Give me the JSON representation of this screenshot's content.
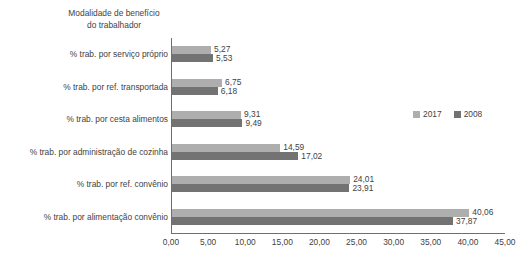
{
  "chart_data": {
    "type": "bar",
    "orientation": "horizontal",
    "title": "",
    "axis_title": "Modalidade de benefício\ndo trabalhador",
    "xlabel": "",
    "ylabel": "",
    "categories": [
      "% trab. por serviço próprio",
      "% trab. por ref. transportada",
      "% trab. por cesta alimentos",
      "% trab. por administração de cozinha",
      "% trab. por ref. convênio",
      "% trab. por alimentação convênio"
    ],
    "series": [
      {
        "name": "2017",
        "color": "#aeaeae",
        "values": [
          5.27,
          6.75,
          9.31,
          14.59,
          24.01,
          40.06
        ],
        "labels": [
          "5,27",
          "6,75",
          "9,31",
          "14,59",
          "24,01",
          "40,06"
        ]
      },
      {
        "name": "2008",
        "color": "#737373",
        "values": [
          5.53,
          6.18,
          9.49,
          17.02,
          23.91,
          37.87
        ],
        "labels": [
          "5,53",
          "6,18",
          "9,49",
          "17,02",
          "23,91",
          "37,87"
        ]
      }
    ],
    "xlim": [
      0,
      45
    ],
    "xticks": [
      0,
      5,
      10,
      15,
      20,
      25,
      30,
      35,
      40,
      45
    ],
    "xtick_labels": [
      "0,00",
      "5,00",
      "10,00",
      "15,00",
      "20,00",
      "25,00",
      "30,00",
      "35,00",
      "40,00",
      "45,00"
    ],
    "grid": false,
    "legend_position": "right",
    "legend": [
      "2017",
      "2008"
    ]
  }
}
